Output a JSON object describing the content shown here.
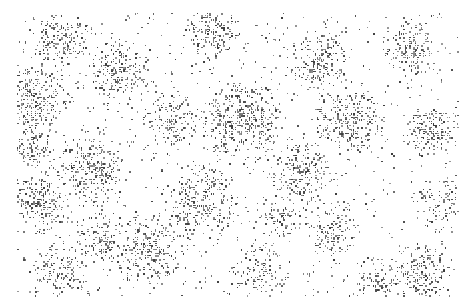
{
  "image": {
    "description": "Dense speckle / noise texture of dark grey glyph-like marks clustered on a white background",
    "background": "#ffffff",
    "ink": "#3a3a3a",
    "bounds": {
      "x": 17,
      "y": 13,
      "width": 441,
      "height": 283
    },
    "clusters": [
      [
        30,
        100,
        40,
        0.9
      ],
      [
        60,
        40,
        30,
        0.8
      ],
      [
        120,
        70,
        35,
        0.8
      ],
      [
        90,
        170,
        40,
        0.8
      ],
      [
        40,
        200,
        35,
        0.8
      ],
      [
        210,
        30,
        30,
        0.8
      ],
      [
        240,
        120,
        45,
        0.85
      ],
      [
        200,
        200,
        40,
        0.8
      ],
      [
        150,
        250,
        40,
        0.8
      ],
      [
        60,
        270,
        30,
        0.8
      ],
      [
        320,
        60,
        35,
        0.8
      ],
      [
        350,
        120,
        40,
        0.85
      ],
      [
        300,
        170,
        35,
        0.7
      ],
      [
        330,
        230,
        30,
        0.7
      ],
      [
        410,
        50,
        30,
        0.8
      ],
      [
        430,
        130,
        30,
        0.8
      ],
      [
        440,
        200,
        25,
        0.7
      ],
      [
        420,
        275,
        35,
        0.85
      ],
      [
        260,
        270,
        30,
        0.7
      ],
      [
        170,
        120,
        30,
        0.7
      ],
      [
        100,
        240,
        30,
        0.75
      ],
      [
        380,
        280,
        25,
        0.7
      ],
      [
        280,
        220,
        25,
        0.6
      ],
      [
        30,
        150,
        25,
        0.7
      ]
    ]
  }
}
